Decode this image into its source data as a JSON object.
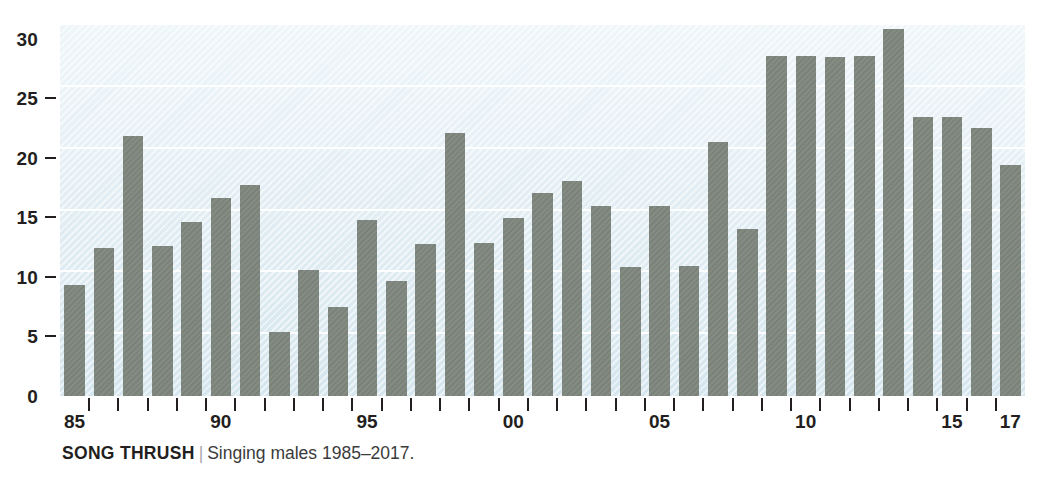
{
  "caption": {
    "title": "SONG THRUSH",
    "separator": "|",
    "subtitle": "Singing males 1985–2017."
  },
  "colors": {
    "bar": "#7b8279",
    "plot_background_top": "#eef6f9",
    "plot_background_bottom": "#d6e6ee",
    "gridline": "#ffffff",
    "axis_text": "#231f20",
    "caption_separator": "#a9a9a9"
  },
  "chart_data": {
    "type": "bar",
    "title": "SONG THRUSH",
    "subtitle": "Singing males 1985–2017.",
    "xlabel": "",
    "ylabel": "",
    "ylim": [
      0,
      30
    ],
    "yticks": [
      0,
      5,
      10,
      15,
      20,
      25,
      30
    ],
    "ytick_labels": [
      "0",
      "5",
      "10",
      "15",
      "20",
      "25",
      "30"
    ],
    "grid": "horizontal",
    "legend": "none",
    "categories": [
      "1985",
      "1986",
      "1987",
      "1988",
      "1989",
      "1990",
      "1991",
      "1992",
      "1993",
      "1994",
      "1995",
      "1996",
      "1997",
      "1998",
      "1999",
      "2000",
      "2001",
      "2002",
      "2003",
      "2004",
      "2005",
      "2006",
      "2007",
      "2008",
      "2009",
      "2010",
      "2011",
      "2012",
      "2013",
      "2014",
      "2015",
      "2016",
      "2017"
    ],
    "xtick_labels": [
      {
        "category": "1985",
        "label": "85"
      },
      {
        "category": "1990",
        "label": "90"
      },
      {
        "category": "1995",
        "label": "95"
      },
      {
        "category": "2000",
        "label": "00"
      },
      {
        "category": "2005",
        "label": "05"
      },
      {
        "category": "2010",
        "label": "10"
      },
      {
        "category": "2015",
        "label": "15"
      },
      {
        "category": "2017",
        "label": "17"
      }
    ],
    "values": [
      9.0,
      12.0,
      21.0,
      12.1,
      14.1,
      16.0,
      17.1,
      5.2,
      10.2,
      7.2,
      14.2,
      9.3,
      12.3,
      21.3,
      12.4,
      14.4,
      16.4,
      17.4,
      15.4,
      10.4,
      15.4,
      10.5,
      20.5,
      13.5,
      27.5,
      27.5,
      27.4,
      27.5,
      29.7,
      22.6,
      22.6,
      21.7,
      18.7
    ]
  }
}
